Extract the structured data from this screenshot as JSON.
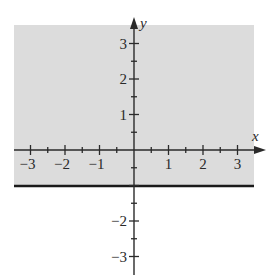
{
  "chart_data": {
    "type": "region",
    "title": "",
    "inequality": "y > -1",
    "boundary_line": {
      "equation": "y = -1",
      "style": "solid"
    },
    "shaded_region": "above boundary",
    "xlabel": "x",
    "ylabel": "y",
    "xlim": [
      -3.5,
      3.7
    ],
    "ylim": [
      -3.5,
      3.5
    ],
    "x_ticks": [
      -3,
      -2,
      -1,
      1,
      2,
      3
    ],
    "y_ticks": [
      -3,
      -2,
      1,
      2,
      3
    ],
    "x_tick_labels": [
      "−3",
      "−2",
      "−1",
      "1",
      "2",
      "3"
    ],
    "y_tick_labels": [
      "−3",
      "−2",
      "1",
      "2",
      "3"
    ],
    "minor_ticks": 0.5,
    "grid": false,
    "colors": {
      "shade": "#dcdcdc",
      "line": "#1a1a1a",
      "axis": "#2a2a2a"
    }
  }
}
